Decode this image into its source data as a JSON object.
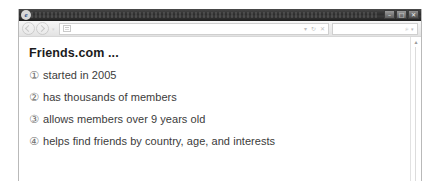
{
  "window": {
    "app_logo": "e",
    "controls": [
      {
        "name": "minimize",
        "glyph": "–"
      },
      {
        "name": "maximize",
        "glyph": "□"
      },
      {
        "name": "close",
        "glyph": "✕"
      }
    ]
  },
  "toolbar": {
    "back_icon": "back-arrow-icon",
    "forward_icon": "forward-arrow-icon",
    "recent_pages_caret": "▾",
    "favicon": "page-favicon",
    "address_value": "",
    "address_placeholder": "",
    "address_icons": [
      {
        "name": "compatibility-view-icon",
        "glyph": "▾"
      },
      {
        "name": "refresh-icon",
        "glyph": "↻"
      },
      {
        "name": "stop-icon",
        "glyph": "✕"
      }
    ],
    "search_value": "",
    "search_placeholder": "",
    "search_icon": "⌕",
    "search_caret": "▾"
  },
  "page": {
    "heading": "Friends.com ...",
    "facts": [
      {
        "marker": "①",
        "text": "started in 2005"
      },
      {
        "marker": "②",
        "text": "has thousands of members"
      },
      {
        "marker": "③",
        "text": "allows members over 9 years old"
      },
      {
        "marker": "④",
        "text": "helps find friends by country, age, and interests"
      }
    ]
  },
  "scrollbar": {
    "up_glyph": "▴"
  },
  "colors": {
    "titlebar": "#2e2e2e",
    "toolbar": "#ebebeb",
    "page_background": "#ffffff",
    "heading_text": "#1b1b1b",
    "body_text": "#3b3b3b",
    "marker_text": "#6e6e6e"
  }
}
